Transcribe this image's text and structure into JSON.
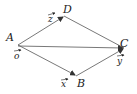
{
  "diagram": {
    "type": "vector-parallelogram",
    "stroke_color": "#555555",
    "text_color": "#222222",
    "points": {
      "A": {
        "label": "A",
        "x": 18,
        "y": 45
      },
      "B": {
        "label": "B",
        "x": 76,
        "y": 76
      },
      "C": {
        "label": "C",
        "x": 124,
        "y": 48
      },
      "D": {
        "label": "D",
        "x": 64,
        "y": 16
      }
    },
    "vectors": {
      "o": {
        "label": "o",
        "at": "A"
      },
      "x": {
        "label": "x",
        "at": "B"
      },
      "y": {
        "label": "y",
        "at": "C"
      },
      "z": {
        "label": "z",
        "at": "D"
      }
    },
    "edges": [
      {
        "from": "A",
        "to": "D",
        "arrow": true
      },
      {
        "from": "A",
        "to": "B",
        "arrow": true
      },
      {
        "from": "A",
        "to": "C",
        "arrow": true
      },
      {
        "from": "D",
        "to": "C",
        "arrow": false
      },
      {
        "from": "B",
        "to": "C",
        "arrow": true
      }
    ]
  }
}
